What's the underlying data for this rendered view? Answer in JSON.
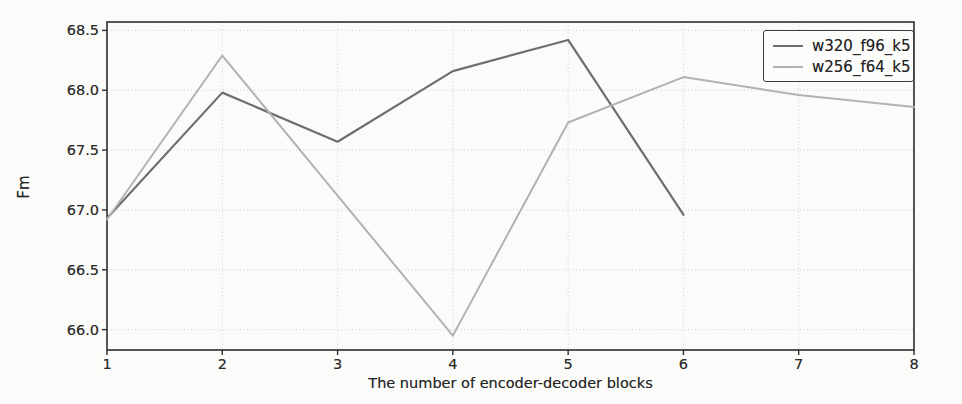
{
  "figure": {
    "background_color": "#fbfbf9",
    "axis_color": "#2e2e2e",
    "grid_color": "#cfcfcf",
    "tick_label_color": "#2b2b2b"
  },
  "chart_data": {
    "type": "line",
    "title": "",
    "xlabel": "The number of encoder-decoder blocks",
    "ylabel": "Fm",
    "xlim": [
      1,
      8
    ],
    "ylim": [
      65.83,
      68.57
    ],
    "xticks": [
      1,
      2,
      3,
      4,
      5,
      6,
      7,
      8
    ],
    "yticks": [
      66.0,
      66.5,
      67.0,
      67.5,
      68.0,
      68.5
    ],
    "grid": true,
    "grid_style": "dotted",
    "legend_position": "upper right",
    "series": [
      {
        "name": "w320_f96_k5",
        "color": "#6e6e6e",
        "x": [
          1,
          2,
          3,
          4,
          5,
          6
        ],
        "values": [
          66.93,
          67.98,
          67.57,
          68.16,
          68.42,
          66.96
        ]
      },
      {
        "name": "w256_f64_k5",
        "color": "#b2b2b2",
        "x": [
          1,
          2,
          3,
          4,
          5,
          6,
          7,
          8
        ],
        "values": [
          66.92,
          68.29,
          67.12,
          65.95,
          67.73,
          68.11,
          67.96,
          67.86
        ]
      }
    ]
  }
}
